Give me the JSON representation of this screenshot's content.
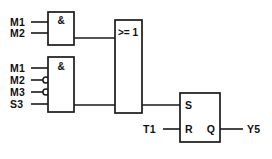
{
  "diagram": {
    "title_fragment": "",
    "type": "logic-function-diagram",
    "notation": "IEC 60617",
    "background_color": "#ffffff",
    "line_color": "#1a1a1a"
  },
  "inputs": {
    "and1": [
      {
        "label": "M1",
        "inverted": false
      },
      {
        "label": "M2",
        "inverted": false
      }
    ],
    "and2": [
      {
        "label": "M1",
        "inverted": false
      },
      {
        "label": "M2",
        "inverted": true
      },
      {
        "label": "M3",
        "inverted": true
      },
      {
        "label": "S3",
        "inverted": false
      }
    ],
    "flipflop_reset": {
      "label": "T1",
      "inverted": false
    }
  },
  "gates": {
    "and1": {
      "symbol": "&",
      "name": "and-gate-1"
    },
    "and2": {
      "symbol": "&",
      "name": "and-gate-2"
    },
    "or1": {
      "symbol": ">= 1",
      "name": "or-gate-1"
    },
    "flipflop": {
      "name": "rs-flipflop",
      "set_pin": "S",
      "reset_pin": "R",
      "output_pin": "Q"
    }
  },
  "outputs": {
    "primary": {
      "label": "Y5"
    }
  }
}
